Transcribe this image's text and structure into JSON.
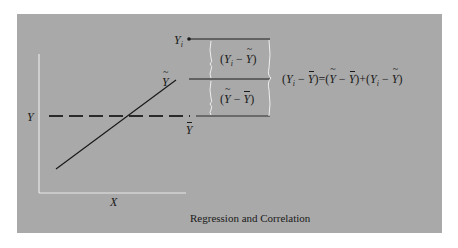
{
  "figure": {
    "caption": "Regression and Correlation",
    "axes": {
      "x_label": "X",
      "y_label": "Y"
    },
    "labels": {
      "observed": "Y",
      "observed_sub": "i",
      "predicted": "Y",
      "mean": "Y"
    },
    "brackets": {
      "upper": {
        "a": "Y",
        "a_sub": "i",
        "minus": "−",
        "b": "Y"
      },
      "lower": {
        "a": "Y",
        "minus": "−",
        "b": "Y"
      }
    },
    "equation": {
      "lhs_a": "Y",
      "lhs_sub": "i",
      "lhs_b": "Y",
      "eq": "=",
      "t1_a": "Y",
      "t1_b": "Y",
      "plus": "+",
      "t2_a": "Y",
      "t2_sub": "i",
      "t2_b": "Y"
    },
    "colors": {
      "panel": "#a9a9a9",
      "ink": "#1a1a1a",
      "axis": "#e8e8e8"
    }
  }
}
